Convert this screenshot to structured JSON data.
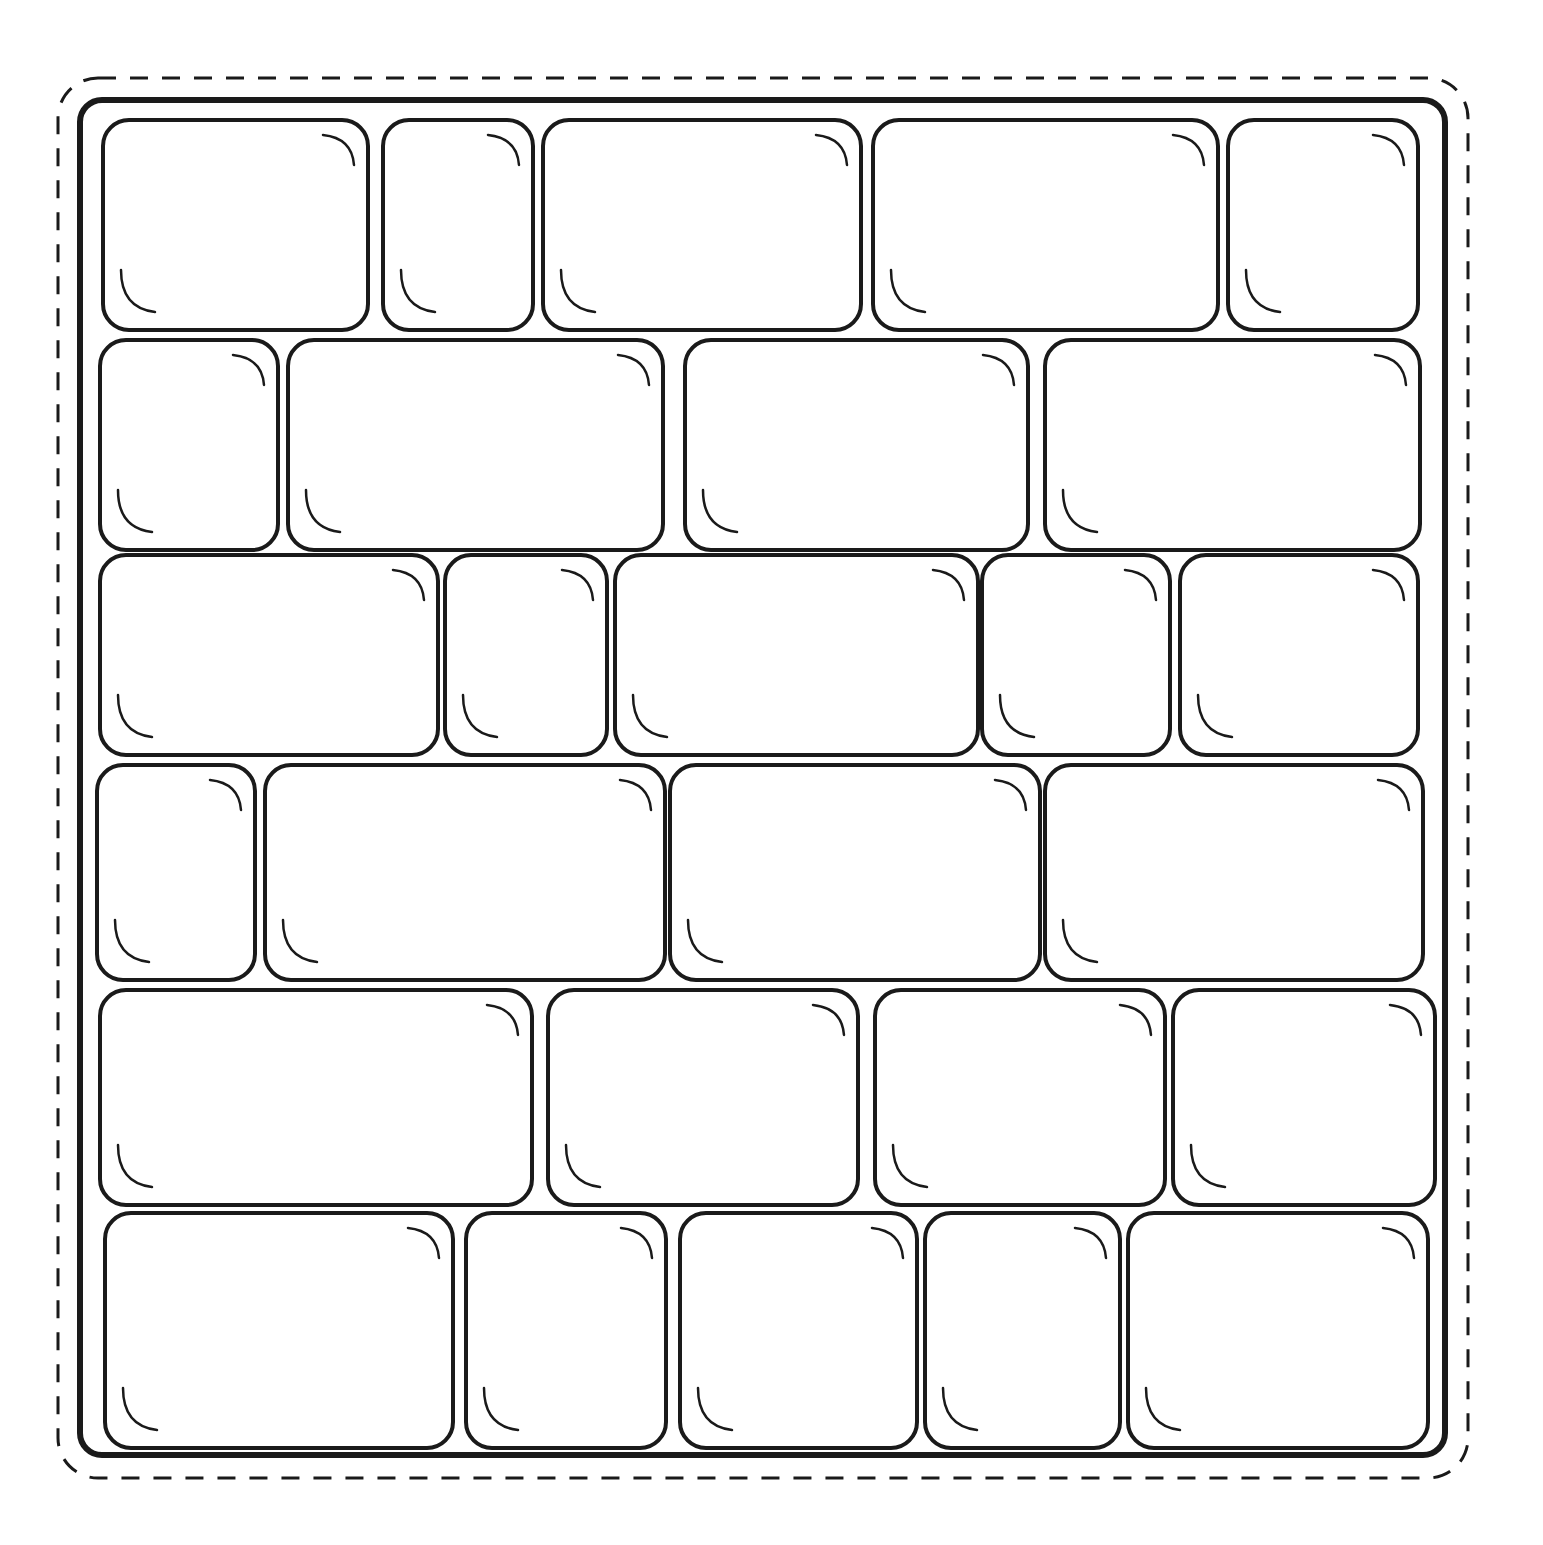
{
  "illustration": {
    "subject": "stone wall coloring page",
    "line_color": "#1a1a1a",
    "background": "#ffffff",
    "frame": {
      "x": 80,
      "y": 100,
      "w": 1365,
      "h": 1355
    },
    "outer_dashed_border": {
      "x": 58,
      "y": 78,
      "w": 1410,
      "h": 1400
    },
    "rows": [
      {
        "y": 120,
        "h": 210,
        "stones": [
          [
            103,
            265
          ],
          [
            383,
            150
          ],
          [
            543,
            318
          ],
          [
            873,
            345
          ],
          [
            1228,
            190
          ]
        ]
      },
      {
        "y": 340,
        "h": 210,
        "stones": [
          [
            100,
            178
          ],
          [
            288,
            375
          ],
          [
            685,
            343
          ],
          [
            1045,
            375
          ]
        ]
      },
      {
        "y": 555,
        "h": 200,
        "stones": [
          [
            100,
            338
          ],
          [
            445,
            162
          ],
          [
            615,
            363
          ],
          [
            982,
            188
          ],
          [
            1180,
            238
          ]
        ]
      },
      {
        "y": 765,
        "h": 215,
        "stones": [
          [
            97,
            158
          ],
          [
            265,
            400
          ],
          [
            670,
            370
          ],
          [
            1045,
            378
          ]
        ]
      },
      {
        "y": 990,
        "h": 215,
        "stones": [
          [
            100,
            432
          ],
          [
            548,
            310
          ],
          [
            875,
            290
          ],
          [
            1173,
            262
          ]
        ]
      },
      {
        "y": 1213,
        "h": 235,
        "stones": [
          [
            105,
            348
          ],
          [
            466,
            200
          ],
          [
            680,
            237
          ],
          [
            925,
            195
          ],
          [
            1128,
            300
          ]
        ]
      }
    ]
  }
}
